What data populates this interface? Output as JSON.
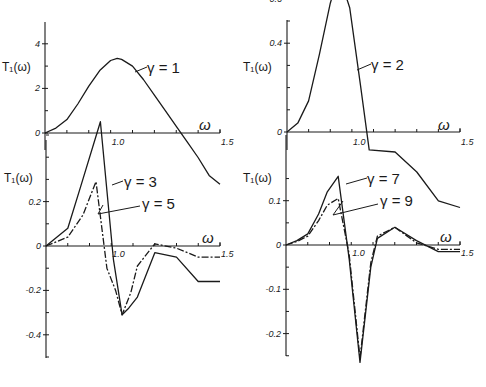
{
  "chart_data": [
    {
      "panel": "top-left",
      "type": "line",
      "xlabel": "ω",
      "ylabel": "T₁(ω)",
      "xlim": [
        0.7,
        1.5
      ],
      "ylim": [
        -0.6,
        5
      ],
      "xticks": [
        0.8,
        0.9,
        1.0,
        1.1,
        1.2,
        1.3,
        1.4,
        1.5
      ],
      "xtick_labels": [
        {
          "v": 1.0,
          "t": "1.0"
        },
        {
          "v": 1.5,
          "t": "1.5"
        }
      ],
      "yticks": [
        0,
        1,
        2,
        3,
        4
      ],
      "ytick_labels": [
        {
          "v": 0,
          "t": "0"
        },
        {
          "v": 2,
          "t": "2"
        },
        {
          "v": 4,
          "t": "4"
        }
      ],
      "series": [
        {
          "name": "γ = 1",
          "style": "solid",
          "x": [
            0.7,
            0.75,
            0.8,
            0.85,
            0.9,
            0.95,
            1.0,
            1.03,
            1.05,
            1.1,
            1.15,
            1.2,
            1.25,
            1.3,
            1.35,
            1.4,
            1.45,
            1.5
          ],
          "y": [
            0.0,
            0.22,
            0.6,
            1.3,
            2.1,
            2.8,
            3.25,
            3.35,
            3.3,
            3.0,
            2.4,
            1.7,
            1.0,
            0.3,
            -0.4,
            -1.1,
            -1.9,
            -2.3
          ]
        }
      ],
      "annotations": [
        {
          "text": "γ = 1",
          "x": 1.22,
          "y": 3.0
        }
      ]
    },
    {
      "panel": "top-right",
      "type": "line",
      "xlabel": "ω",
      "ylabel": "T₁(ω)",
      "xlim": [
        0.7,
        1.5
      ],
      "ylim": [
        -0.08,
        0.8
      ],
      "xticks": [
        0.8,
        0.9,
        1.0,
        1.1,
        1.2,
        1.3,
        1.4,
        1.5
      ],
      "xtick_labels": [
        {
          "v": 1.0,
          "t": "1.0"
        },
        {
          "v": 1.5,
          "t": "1.5"
        }
      ],
      "yticks": [
        0.1,
        0.2,
        0.3,
        0.4,
        0.5,
        0.6,
        0.7
      ],
      "ytick_labels": [
        {
          "v": 0,
          "t": "0"
        },
        {
          "v": 0.4,
          "t": "0.4"
        },
        {
          "v": 0.6,
          "t": "0.6"
        }
      ],
      "series": [
        {
          "name": "γ = 2",
          "style": "solid",
          "x": [
            0.7,
            0.75,
            0.8,
            0.85,
            0.9,
            0.94,
            0.99,
            1.04,
            1.08,
            1.2,
            1.3,
            1.4,
            1.5
          ],
          "y": [
            0.0,
            0.04,
            0.14,
            0.35,
            0.58,
            0.71,
            0.56,
            0.21,
            -0.08,
            -0.09,
            -0.18,
            -0.31,
            -0.34
          ]
        }
      ],
      "annotations": [
        {
          "text": "γ = 2",
          "x": 1.12,
          "y": 0.6
        }
      ]
    },
    {
      "panel": "bottom-left",
      "type": "line",
      "xlabel": "ω",
      "ylabel": "T₁(ω)",
      "xlim": [
        0.7,
        1.5
      ],
      "ylim": [
        -0.5,
        0.5
      ],
      "xticks": [
        0.8,
        0.9,
        1.0,
        1.1,
        1.2,
        1.3,
        1.4,
        1.5
      ],
      "xtick_labels": [
        {
          "v": 1.0,
          "t": "1.0"
        },
        {
          "v": 1.5,
          "t": "1.5"
        }
      ],
      "yticks": [
        -0.5,
        -0.4,
        -0.3,
        -0.2,
        -0.1,
        0.1,
        0.2,
        0.3,
        0.4,
        0.5
      ],
      "ytick_labels": [
        {
          "v": 0,
          "t": "0"
        },
        {
          "v": 0.2,
          "t": "0.2"
        },
        {
          "v": -0.2,
          "t": "-0.2"
        },
        {
          "v": -0.4,
          "t": "-0.4"
        }
      ],
      "series": [
        {
          "name": "γ = 3",
          "style": "solid",
          "x": [
            0.7,
            0.8,
            0.86,
            0.95,
            1.01,
            1.05,
            1.08,
            1.12,
            1.2,
            1.3,
            1.4,
            1.5
          ],
          "y": [
            0.0,
            0.08,
            0.27,
            0.56,
            -0.06,
            -0.31,
            -0.28,
            -0.23,
            -0.03,
            -0.05,
            -0.16,
            -0.16
          ]
        }
      ],
      "annotations": []
    },
    {
      "panel": "bottom-left-gamma5",
      "type": "line",
      "series": [
        {
          "name": "γ = 5",
          "style": "dashed",
          "x": [
            0.7,
            0.8,
            0.87,
            0.93,
            0.98,
            1.02,
            1.05,
            1.09,
            1.12,
            1.2,
            1.3,
            1.4,
            1.5
          ],
          "y": [
            0.0,
            0.04,
            0.14,
            0.29,
            -0.1,
            -0.2,
            -0.31,
            -0.21,
            -0.09,
            0.01,
            -0.01,
            -0.05,
            -0.05
          ]
        }
      ],
      "annotations": [
        {
          "text": "γ = 3",
          "x": 1.1,
          "y": 0.28
        },
        {
          "text": "γ = 5",
          "x": 1.2,
          "y": 0.19
        }
      ]
    },
    {
      "panel": "bottom-right",
      "type": "line",
      "xlabel": "ω",
      "ylabel": "T₁(ω)",
      "xlim": [
        0.7,
        1.5
      ],
      "ylim": [
        -0.25,
        0.18
      ],
      "xticks": [
        0.8,
        0.9,
        1.0,
        1.1,
        1.2,
        1.3,
        1.4,
        1.5
      ],
      "xtick_labels": [
        {
          "v": 1.0,
          "t": "1.0"
        },
        {
          "v": 1.5,
          "t": "1.5"
        }
      ],
      "yticks": [
        -0.25,
        -0.2,
        -0.15,
        -0.1,
        -0.05,
        0.05,
        0.1,
        0.15
      ],
      "ytick_labels": [
        {
          "v": 0,
          "t": "0"
        },
        {
          "v": 0.1,
          "t": "0.1"
        },
        {
          "v": -0.1,
          "t": "-0.1"
        },
        {
          "v": -0.2,
          "t": "-0.2"
        }
      ],
      "series": [
        {
          "name": "γ = 7",
          "style": "solid",
          "x": [
            0.7,
            0.75,
            0.8,
            0.85,
            0.89,
            0.94,
            0.99,
            1.04,
            1.09,
            1.12,
            1.2,
            1.3,
            1.4,
            1.5
          ],
          "y": [
            0.0,
            0.01,
            0.025,
            0.07,
            0.12,
            0.155,
            -0.03,
            -0.265,
            -0.05,
            0.015,
            0.04,
            0.01,
            -0.015,
            -0.015
          ]
        },
        {
          "name": "γ = 9",
          "style": "dashed",
          "x": [
            0.7,
            0.75,
            0.8,
            0.85,
            0.89,
            0.94,
            0.99,
            1.04,
            1.09,
            1.12,
            1.2,
            1.3,
            1.4,
            1.5
          ],
          "y": [
            0.0,
            0.008,
            0.02,
            0.055,
            0.09,
            0.105,
            -0.02,
            -0.255,
            -0.04,
            0.02,
            0.04,
            0.005,
            -0.01,
            -0.01
          ]
        }
      ],
      "annotations": [
        {
          "text": "γ = 7",
          "x": 1.12,
          "y": 0.09
        },
        {
          "text": "γ = 9",
          "x": 1.22,
          "y": 0.06
        }
      ]
    }
  ],
  "labels": {
    "ylabel": "T₁(ω)",
    "xlabel": "ω",
    "g1": "γ = 1",
    "g2": "γ = 2",
    "g3": "γ = 3",
    "g5": "γ = 5",
    "g7": "γ = 7",
    "g9": "γ = 9"
  }
}
